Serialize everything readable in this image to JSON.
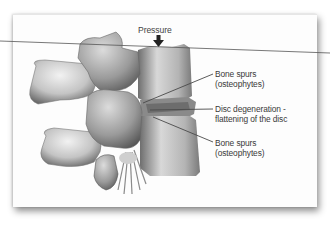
{
  "diagram": {
    "top_label": "Pressure",
    "labels": [
      {
        "line1": "Bone spurs",
        "line2": "(osteophytes)"
      },
      {
        "line1": "Disc degeneration -",
        "line2": "flattening of the disc"
      },
      {
        "line1": "Bone spurs",
        "line2": "(osteophytes)"
      }
    ],
    "colors": {
      "background": "#ffffff",
      "card": "#fdfdfd",
      "text": "#3a3a3a",
      "leader_line": "#4a4a4a",
      "bone_light": "#e8e8e8",
      "bone_mid": "#a8a8a8",
      "bone_dark": "#5a5a5a"
    }
  }
}
